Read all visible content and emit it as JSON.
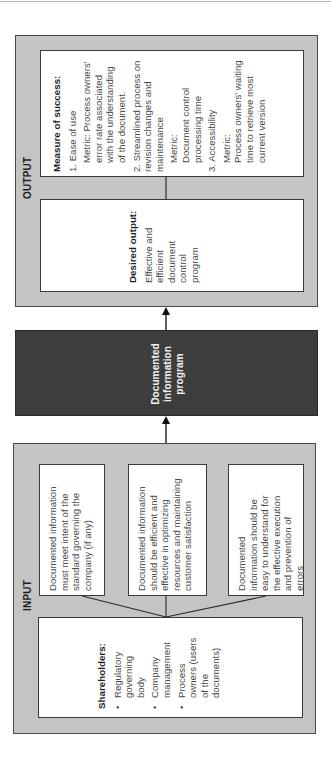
{
  "output": {
    "label": "OUTPUT",
    "measure": {
      "heading": "Measure of success:",
      "items": [
        {
          "title": "1. Ease of use",
          "metric": "Metric: Process owners' error rate associated with the understanding of the document."
        },
        {
          "title": "2. Streamlined process on revision changes and maintenance",
          "metric_label": "Metric:",
          "metric": "Document control processing time"
        },
        {
          "title": "3. Accessibility",
          "metric_label": "Metric:",
          "metric": "Process owners' waiting time to retrieve most current version"
        }
      ]
    },
    "desired": {
      "heading": "Desired output:",
      "text": "Effective and efficient document control program"
    }
  },
  "program": {
    "label": "Documented information program"
  },
  "input": {
    "label": "INPUT",
    "requirements": [
      "Documented information must meet intent of the standard governing the company (if any)",
      "Documented information should be efficient and effective in optimizing resources and maintaining customer satisfaction",
      "Documented information should be easy to understand for the effective execution and prevention of errors"
    ],
    "shareholders": {
      "heading": "Shareholders:",
      "bullet": "•",
      "items": [
        "Regulatory governing body",
        "Company management",
        "Process owners (users of the documents)"
      ]
    }
  },
  "colors": {
    "frame_fill": "#c4c4c4",
    "dark_box": "#3d3d3d",
    "box_fill": "#ffffff",
    "border": "#3a3a3a"
  }
}
